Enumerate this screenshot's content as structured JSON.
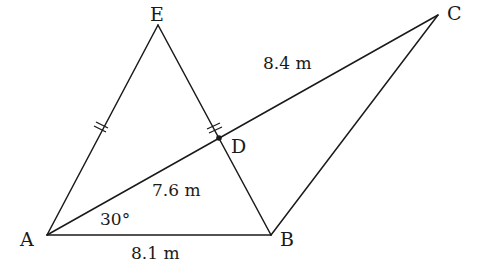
{
  "diagram": {
    "type": "geometry",
    "points": {
      "A": {
        "label": "A",
        "x": 47,
        "y": 235
      },
      "B": {
        "label": "B",
        "x": 271,
        "y": 235
      },
      "C": {
        "label": "C",
        "x": 438,
        "y": 15
      },
      "D": {
        "label": "D",
        "x": 219,
        "y": 138
      },
      "E": {
        "label": "E",
        "x": 158,
        "y": 25
      }
    },
    "segments": [
      "AB",
      "AC",
      "BC",
      "AE",
      "EB"
    ],
    "measurements": {
      "AB": "8.1 m",
      "AD": "7.6 m",
      "DC": "8.4 m",
      "angle_BAD": "30°"
    },
    "equal_marks": {
      "segments": [
        "AE",
        "ED"
      ],
      "mark": "double-tick"
    },
    "colors": {
      "line": "#1a1a1a",
      "background": "#ffffff"
    }
  }
}
